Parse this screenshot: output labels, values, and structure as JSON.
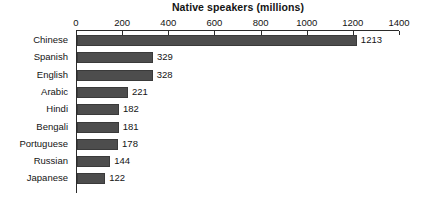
{
  "chart_data": {
    "type": "bar",
    "orientation": "horizontal",
    "title": "Native speakers (millions)",
    "xlabel": "",
    "ylabel": "",
    "categories": [
      "Chinese",
      "Spanish",
      "English",
      "Arabic",
      "Hindi",
      "Bengali",
      "Portuguese",
      "Russian",
      "Japanese"
    ],
    "values": [
      1213,
      329,
      328,
      221,
      182,
      181,
      178,
      144,
      122
    ],
    "value_labels": [
      "1213",
      "329",
      "328",
      "221",
      "182",
      "181",
      "178",
      "144",
      "122"
    ],
    "xlim": [
      0,
      1400
    ],
    "xticks": [
      0,
      200,
      400,
      600,
      800,
      1000,
      1200,
      1400
    ],
    "xtick_labels": [
      "0",
      "200",
      "400",
      "600",
      "800",
      "1000",
      "1200",
      "1400"
    ],
    "grid": false,
    "legend": null,
    "bar_color": "#4d4d4d",
    "bar_edge_color": "#3a3a3a",
    "axis_color": "#2b2b2b",
    "background_color": "#ffffff",
    "text_color": "#141414"
  }
}
